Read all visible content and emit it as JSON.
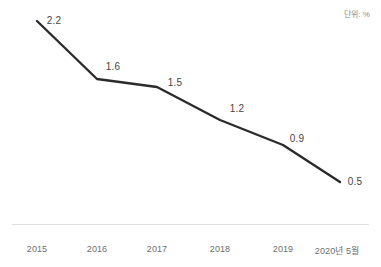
{
  "unit_note": "단위: %",
  "chart_data": {
    "type": "line",
    "title": "",
    "subtitle": "",
    "xlabel": "",
    "ylabel": "",
    "unit": "%",
    "grid": false,
    "legend": false,
    "legend_position": "none",
    "line_color": "#2b2b2b",
    "label_color": "#454545",
    "tick_color": "#6e6e6e",
    "axis_color": "#dedede",
    "categories": [
      "2015",
      "2016",
      "2017",
      "2018",
      "2019",
      "2020년 5월"
    ],
    "values": [
      2.2,
      1.6,
      1.5,
      1.2,
      0.9,
      0.5
    ],
    "point_labels": [
      "2.2",
      "1.6",
      "1.5",
      "1.2",
      "0.9",
      "0.5"
    ],
    "ylim": [
      0,
      2.4
    ],
    "points": [
      {
        "category": "2015",
        "value": 2.2,
        "label": "2.2",
        "px": 37,
        "py": 21,
        "label_x": 54,
        "label_y": 20,
        "tick_x": 37
      },
      {
        "category": "2016",
        "value": 1.6,
        "label": "1.6",
        "px": 97,
        "py": 79,
        "label_x": 113,
        "label_y": 66,
        "tick_x": 97
      },
      {
        "category": "2017",
        "value": 1.5,
        "label": "1.5",
        "px": 157,
        "py": 87,
        "label_x": 175,
        "label_y": 82,
        "tick_x": 157
      },
      {
        "category": "2018",
        "value": 1.2,
        "label": "1.2",
        "px": 220,
        "py": 120,
        "label_x": 237,
        "label_y": 108,
        "tick_x": 220
      },
      {
        "category": "2019",
        "value": 0.9,
        "label": "0.9",
        "px": 283,
        "py": 145,
        "label_x": 297,
        "label_y": 138,
        "tick_x": 283
      },
      {
        "category": "2020년 5월",
        "value": 0.5,
        "label": "0.5",
        "px": 340,
        "py": 182,
        "label_x": 355,
        "label_y": 181,
        "tick_x": 337
      }
    ],
    "tick_label_y": 244
  }
}
